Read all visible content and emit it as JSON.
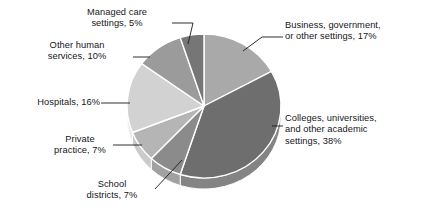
{
  "chart_data": {
    "type": "pie",
    "title": "",
    "subtitle": "",
    "xlabel": "",
    "ylabel": "",
    "legend_position": "callout-labels",
    "grid": false,
    "value_unit": "percent",
    "start_angle_deg": 0,
    "direction": "clockwise",
    "categories": [
      "Business, government, or other settings",
      "Colleges, universities, and other academic settings",
      "School districts",
      "Private practice",
      "Hospitals",
      "Other human services",
      "Managed care settings"
    ],
    "values": [
      17,
      38,
      7,
      7,
      16,
      10,
      5
    ],
    "colors": [
      "#a9a9a9",
      "#6e6e6e",
      "#8b8b8b",
      "#b5b5b5",
      "#d2d2d2",
      "#9b9b9b",
      "#767676"
    ],
    "slices": [
      {
        "label": "Business, government, or other settings",
        "value": 17,
        "display": "Business, government,\nor other settings, 17%",
        "color": "#a9a9a9"
      },
      {
        "label": "Colleges, universities, and other academic settings",
        "value": 38,
        "display": "Colleges, universities,\nand other academic\nsettings, 38%",
        "color": "#6e6e6e"
      },
      {
        "label": "School districts",
        "value": 7,
        "display": "School\ndistricts, 7%",
        "color": "#8b8b8b"
      },
      {
        "label": "Private practice",
        "value": 7,
        "display": "Private\npractice, 7%",
        "color": "#b5b5b5"
      },
      {
        "label": "Hospitals",
        "value": 16,
        "display": "Hospitals, 16%",
        "color": "#d2d2d2"
      },
      {
        "label": "Other human services",
        "value": 10,
        "display": "Other human\nservices, 10%",
        "color": "#9b9b9b"
      },
      {
        "label": "Managed care settings",
        "value": 5,
        "display": "Managed care\nsettings, 5%",
        "color": "#767676"
      }
    ]
  },
  "geometry": {
    "center_x": 204,
    "center_y": 106,
    "radius_x": 77,
    "radius_y": 72,
    "depth": 11,
    "separator_color": "#ffffff",
    "side_wall_color": "#b8b8b8",
    "leader_color": "#1a1a1a"
  }
}
